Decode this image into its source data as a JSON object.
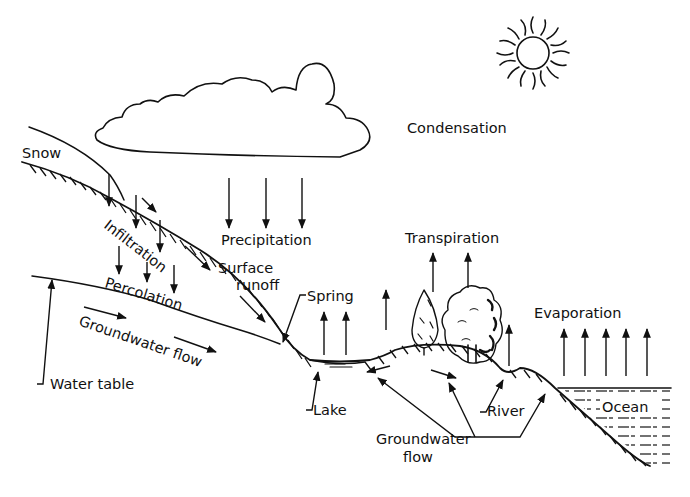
{
  "diagram": {
    "colors": {
      "ink": "#111111",
      "background": "#ffffff"
    },
    "labels": {
      "condensation": "Condensation",
      "snow": "Snow",
      "precipitation": "Precipitation",
      "infiltration": "Infiltration",
      "surface_runoff_1": "Surface",
      "surface_runoff_2": "runoff",
      "percolation": "Percolation",
      "groundwater_flow_slope": "Groundwater flow",
      "water_table": "Water table",
      "spring": "Spring",
      "transpiration": "Transpiration",
      "evaporation": "Evaporation",
      "lake": "Lake",
      "river": "River",
      "ocean": "Ocean",
      "groundwater_flow_1": "Groundwater",
      "groundwater_flow_2": "flow"
    },
    "elements": [
      "sun-icon",
      "cloud",
      "snow-cap",
      "hillside-slope",
      "water-table-line",
      "lake",
      "trees",
      "river",
      "ocean"
    ]
  }
}
